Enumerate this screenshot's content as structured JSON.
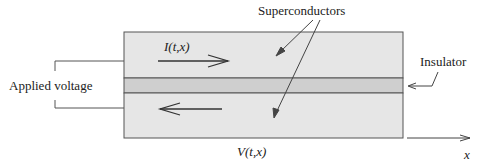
{
  "diagram": {
    "labels": {
      "superconductors": "Superconductors",
      "insulator": "Insulator",
      "applied_voltage": "Applied voltage",
      "current": "I(t,x)",
      "voltage": "V(t,x)",
      "x_axis": "x"
    },
    "regions": [
      {
        "name": "top-superconductor",
        "fill": "#e6e6e6"
      },
      {
        "name": "insulator-layer",
        "fill": "#cfcfcf"
      },
      {
        "name": "bottom-superconductor",
        "fill": "#e6e6e6"
      }
    ],
    "colors": {
      "stroke": "#555555",
      "arrow": "#333333",
      "background": "#ffffff"
    }
  }
}
